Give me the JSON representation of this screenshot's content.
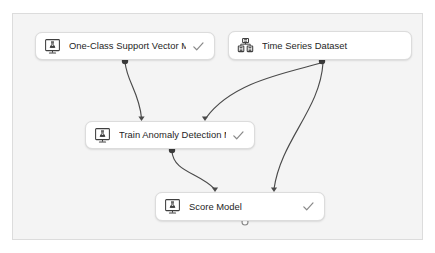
{
  "canvas": {
    "background_color": "#f4f4f4",
    "border_color": "#dcdcdc"
  },
  "theme": {
    "node_background": "#ffffff",
    "node_border": "#dcdcdc",
    "edge_color": "#4a4a4a",
    "port_filled": "#3b3b3b",
    "port_hollow": "#ffffff",
    "check_color": "#8a8a8a",
    "icon_color": "#3f3f3f",
    "label_color": "#252525"
  },
  "nodes": [
    {
      "id": "one-class-svm",
      "label": "One-Class Support Vector M...",
      "icon": "module-icon",
      "status_icon": "check-icon",
      "has_status": true,
      "x": 35,
      "y": 32,
      "w": 180,
      "h": 28
    },
    {
      "id": "time-series-dataset",
      "label": "Time Series Dataset",
      "icon": "dataset-icon",
      "status_icon": "",
      "has_status": false,
      "x": 228,
      "y": 31,
      "w": 184,
      "h": 29
    },
    {
      "id": "train-anomaly-detection-model",
      "label": "Train Anomaly Detection M...",
      "icon": "module-icon",
      "status_icon": "check-icon",
      "has_status": true,
      "x": 85,
      "y": 121,
      "w": 170,
      "h": 28
    },
    {
      "id": "score-model",
      "label": "Score Model",
      "icon": "module-icon",
      "status_icon": "check-icon",
      "has_status": true,
      "x": 155,
      "y": 192,
      "w": 170,
      "h": 29
    }
  ],
  "ports": [
    {
      "id": "out-one-class-svm",
      "node": "one-class-svm",
      "type": "output",
      "state": "filled",
      "cx": 125,
      "cy": 61
    },
    {
      "id": "out-time-series",
      "node": "time-series-dataset",
      "type": "output",
      "state": "filled",
      "cx": 322,
      "cy": 61
    },
    {
      "id": "out-train-model",
      "node": "train-anomaly-detection-model",
      "type": "output",
      "state": "filled",
      "cx": 172,
      "cy": 150
    },
    {
      "id": "out-score-model",
      "node": "score-model",
      "type": "output",
      "state": "hollow",
      "cx": 245,
      "cy": 222
    }
  ],
  "edges": [
    {
      "id": "edge-svm-to-train",
      "from": "out-one-class-svm",
      "to": "train-anomaly-detection-model",
      "path": "M125,62 C127,82 139,92 141.5,118",
      "arrow": {
        "x": 141.5,
        "y": 121
      }
    },
    {
      "id": "edge-dataset-to-train",
      "from": "out-time-series",
      "to": "train-anomaly-detection-model",
      "path": "M321,63 C286,73 232,82 206,118",
      "arrow": {
        "x": 205,
        "y": 121
      }
    },
    {
      "id": "edge-train-to-score",
      "from": "out-train-model",
      "to": "score-model",
      "path": "M172,151 C173,172 200,173 214.5,189",
      "arrow": {
        "x": 215,
        "y": 192
      }
    },
    {
      "id": "edge-dataset-to-score",
      "from": "out-time-series",
      "to": "score-model",
      "path": "M323,63 C320,110 281,140 274,189",
      "arrow": {
        "x": 274,
        "y": 192
      }
    }
  ]
}
